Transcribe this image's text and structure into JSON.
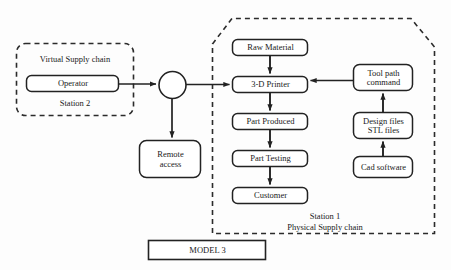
{
  "diagram": {
    "title": "MODEL 3",
    "style": {
      "background": "#fdfdfd",
      "stroke": "#222222",
      "node_fill": "#ffffff",
      "dashed_stroke": "#2b2b2b"
    },
    "groups": [
      {
        "id": "virtual-supply-chain",
        "title": "Virtual Supply chain",
        "station": "Station 2",
        "shape": "dashed-rounded-rect"
      },
      {
        "id": "physical-supply-chain",
        "title": "Physical Supply chain",
        "station": "Station 1",
        "shape": "dashed-clipped-rect"
      }
    ],
    "nodes": [
      {
        "id": "operator",
        "label": "Operator",
        "shape": "rounded-rect"
      },
      {
        "id": "junction",
        "label": "",
        "shape": "circle"
      },
      {
        "id": "remote-access",
        "label": "Remote\naccess",
        "shape": "rounded-rect"
      },
      {
        "id": "raw-material",
        "label": "Raw Material",
        "shape": "rounded-rect"
      },
      {
        "id": "3d-printer",
        "label": "3-D Printer",
        "shape": "rounded-rect"
      },
      {
        "id": "part-produced",
        "label": "Part Produced",
        "shape": "rounded-rect"
      },
      {
        "id": "part-testing",
        "label": "Part Testing",
        "shape": "rounded-rect"
      },
      {
        "id": "customer",
        "label": "Customer",
        "shape": "rounded-rect"
      },
      {
        "id": "tool-path-command",
        "label": "Tool path\ncommand",
        "shape": "rounded-rect"
      },
      {
        "id": "design-files",
        "label": "Design files\nSTL files",
        "shape": "rounded-rect"
      },
      {
        "id": "cad-software",
        "label": "Cad software",
        "shape": "rounded-rect"
      },
      {
        "id": "model-title",
        "label": "MODEL 3",
        "shape": "rect"
      }
    ],
    "edges": [
      {
        "id": "operator-to-junction",
        "from": "operator",
        "to": "junction",
        "direction": "right"
      },
      {
        "id": "junction-to-printer",
        "from": "junction",
        "to": "3d-printer",
        "direction": "right"
      },
      {
        "id": "junction-to-remote",
        "from": "junction",
        "to": "remote-access",
        "direction": "down"
      },
      {
        "id": "raw-to-printer",
        "from": "raw-material",
        "to": "3d-printer",
        "direction": "down"
      },
      {
        "id": "printer-to-part",
        "from": "3d-printer",
        "to": "part-produced",
        "direction": "down"
      },
      {
        "id": "part-to-testing",
        "from": "part-produced",
        "to": "part-testing",
        "direction": "down"
      },
      {
        "id": "testing-to-customer",
        "from": "part-testing",
        "to": "customer",
        "direction": "down"
      },
      {
        "id": "toolpath-to-printer",
        "from": "tool-path-command",
        "to": "3d-printer",
        "direction": "left"
      },
      {
        "id": "design-to-toolpath",
        "from": "design-files",
        "to": "tool-path-command",
        "direction": "up"
      },
      {
        "id": "cad-to-design",
        "from": "cad-software",
        "to": "design-files",
        "direction": "up"
      }
    ]
  }
}
